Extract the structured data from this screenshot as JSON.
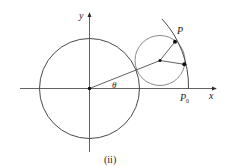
{
  "figure": {
    "caption": "(ii)",
    "labels": {
      "y_axis": "y",
      "x_axis": "x",
      "angle": "θ",
      "point_p": "P",
      "point_p0": "P",
      "point_p0_subscript": "0"
    },
    "colors": {
      "axis": "#3a3a3a",
      "big_circle": "#4a4a4a",
      "small_circle": "#8a8a8a",
      "arc": "#4a4a4a",
      "point": "#111111"
    }
  }
}
